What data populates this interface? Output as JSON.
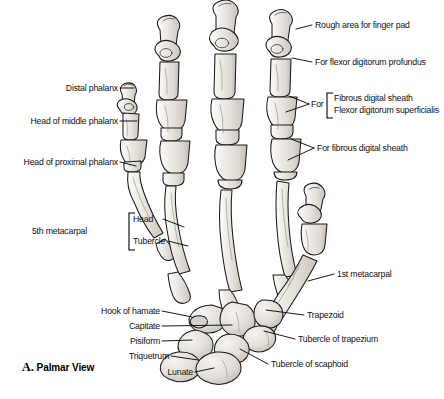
{
  "figure": {
    "caption_letter": "A.",
    "caption_text": "Palmar View",
    "background": "#ffffff",
    "bone_fill": "#e9e6e1",
    "bone_stroke": "#1a1a1a",
    "leader_color": "#000000"
  },
  "labels": {
    "left": [
      {
        "id": "distal-phalanx",
        "text": "Distal phalanx",
        "x": 118,
        "y": 90
      },
      {
        "id": "head-of-middle-phalanx",
        "text": "Head of middle phalanx",
        "x": 118,
        "y": 123
      },
      {
        "id": "head-of-proximal-phalanx",
        "text": "Head of proximal phalanx",
        "x": 118,
        "y": 164
      },
      {
        "id": "fifth-metacarpal",
        "text": "5th metacarpal",
        "x": 87,
        "y": 232
      },
      {
        "id": "head",
        "text": "Head",
        "x": 133,
        "y": 222
      },
      {
        "id": "tubercle",
        "text": "Tubercle",
        "x": 133,
        "y": 243
      },
      {
        "id": "hook-of-hamate",
        "text": "Hook of hamate",
        "x": 160,
        "y": 313
      },
      {
        "id": "capitate",
        "text": "Capitate",
        "x": 160,
        "y": 328
      },
      {
        "id": "pisiform",
        "text": "Pisiform",
        "x": 160,
        "y": 343
      },
      {
        "id": "triquetrum",
        "text": "Triquetrum",
        "x": 169,
        "y": 358
      },
      {
        "id": "lunate",
        "text": "Lunate",
        "x": 193,
        "y": 374
      }
    ],
    "right": [
      {
        "id": "rough-area-for-finger-pad",
        "text": "Rough area for finger pad",
        "x": 314,
        "y": 27
      },
      {
        "id": "for-flexor-digitorum-profundus",
        "text": "For flexor digitorum profundus",
        "x": 314,
        "y": 64
      },
      {
        "id": "for-prefix",
        "text": "For",
        "x": 311,
        "y": 105
      },
      {
        "id": "fibrous-digital-sheath",
        "text": "Fibrous digital sheath",
        "x": 330,
        "y": 100
      },
      {
        "id": "flexor-digitorum-superficialis",
        "text": "Flexor digitorum superficialis",
        "x": 330,
        "y": 112
      },
      {
        "id": "for-fibrous-digital-sheath",
        "text": "For fibrous digital sheath",
        "x": 316,
        "y": 150
      },
      {
        "id": "first-metacarpal",
        "text": "1st metacarpal",
        "x": 336,
        "y": 276
      },
      {
        "id": "trapezoid",
        "text": "Trapezoid",
        "x": 306,
        "y": 317
      },
      {
        "id": "tubercle-of-trapezium",
        "text": "Tubercle of trapezium",
        "x": 297,
        "y": 341
      },
      {
        "id": "tubercle-of-scaphoid",
        "text": "Tubercle of scaphoid",
        "x": 270,
        "y": 366
      }
    ]
  }
}
